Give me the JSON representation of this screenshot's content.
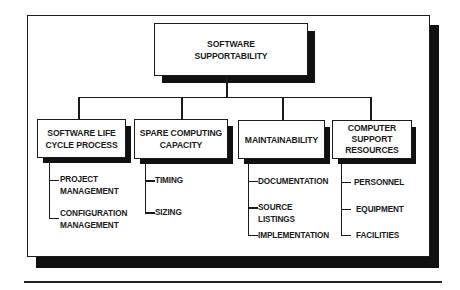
{
  "diagram": {
    "type": "hierarchy",
    "root": {
      "title_lines": [
        "SOFTWARE",
        "SUPPORTABILITY"
      ]
    },
    "categories": [
      {
        "title_lines": [
          "SOFTWARE LIFE",
          "CYCLE PROCESS"
        ],
        "children": [
          {
            "lines": [
              "PROJECT",
              "MANAGEMENT"
            ]
          },
          {
            "lines": [
              "CONFIGURATION",
              "MANAGEMENT"
            ]
          }
        ]
      },
      {
        "title_lines": [
          "SPARE COMPUTING",
          "CAPACITY"
        ],
        "children": [
          {
            "lines": [
              "TIMING"
            ]
          },
          {
            "lines": [
              "SIZING"
            ]
          }
        ]
      },
      {
        "title_lines": [
          "MAINTAINABILITY"
        ],
        "children": [
          {
            "lines": [
              "DOCUMENTATION"
            ]
          },
          {
            "lines": [
              "SOURCE",
              "LISTINGS"
            ]
          },
          {
            "lines": [
              "IMPLEMENTATION"
            ]
          }
        ]
      },
      {
        "title_lines": [
          "COMPUTER",
          "SUPPORT",
          "RESOURCES"
        ],
        "children": [
          {
            "lines": [
              "PERSONNEL"
            ]
          },
          {
            "lines": [
              "EQUIPMENT"
            ]
          },
          {
            "lines": [
              "FACILITIES"
            ]
          }
        ]
      }
    ]
  },
  "colors": {
    "ink": "#1a1a1a",
    "shadow": "#111111",
    "background": "#ffffff"
  }
}
